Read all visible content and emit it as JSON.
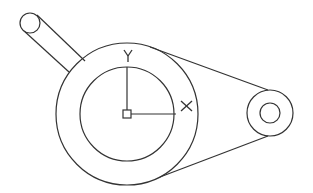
{
  "diagram": {
    "type": "cad-drawing",
    "stroke_color": "#333333",
    "background": "#ffffff",
    "main_hub": {
      "outer_circle": {
        "cx": 127,
        "cy": 114,
        "r": 71
      },
      "inner_circle": {
        "cx": 127,
        "cy": 114,
        "r": 47
      }
    },
    "arm": {
      "end_circle": {
        "cx": 30,
        "cy": 23,
        "r": 10
      },
      "edge_top": {
        "x1": 38,
        "y1": 16,
        "x2": 83,
        "y2": 61
      },
      "edge_bottom": {
        "x1": 24,
        "y1": 31,
        "x2": 69,
        "y2": 72
      }
    },
    "pulley": {
      "outer_circle": {
        "cx": 270,
        "cy": 113,
        "r": 23
      },
      "inner_circle": {
        "cx": 270,
        "cy": 113,
        "r": 10
      }
    },
    "belt": {
      "top_tangent": {
        "x1": 150,
        "y1": 47,
        "x2": 268,
        "y2": 90
      },
      "bottom_tangent": {
        "x1": 160,
        "y1": 177,
        "x2": 268,
        "y2": 136
      }
    },
    "ucs_icon": {
      "origin": {
        "x": 127,
        "y": 114
      },
      "x_axis_end": {
        "x": 176,
        "y": 114
      },
      "y_axis_end": {
        "x": 127,
        "y": 67
      },
      "x_label": "X",
      "y_label": "Y"
    }
  }
}
